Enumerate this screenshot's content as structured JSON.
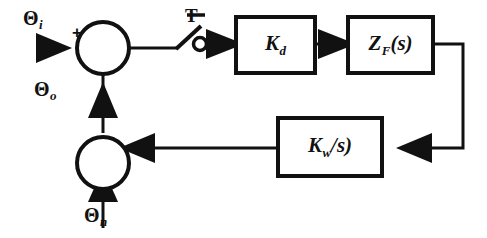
{
  "diagram": {
    "type": "control-system-block-diagram",
    "canvas": {
      "width": 487,
      "height": 238
    },
    "colors": {
      "stroke": "#111111",
      "background": "#ffffff",
      "text": "#111111"
    },
    "signals": {
      "input": {
        "symbol": "Θ",
        "subscript": "i",
        "label": "Θi"
      },
      "output_feedback": {
        "symbol": "Θ",
        "subscript": "o",
        "label": "Θo"
      },
      "noise": {
        "symbol": "Θ",
        "subscript": "n",
        "label": "Θn"
      }
    },
    "sum_signs": {
      "positive": "+"
    },
    "sampler": {
      "label": "T",
      "contact": "open-circle"
    },
    "blocks": [
      {
        "id": "kd",
        "symbol": "K",
        "subscript": "d",
        "suffix": "",
        "label": "Kd"
      },
      {
        "id": "zf",
        "symbol": "Z",
        "subscript": "F",
        "suffix": "(s)",
        "label": "ZF(s)"
      },
      {
        "id": "kw",
        "symbol": "K",
        "subscript": "w",
        "suffix": "/s)",
        "label": "Kw/s)"
      }
    ]
  }
}
